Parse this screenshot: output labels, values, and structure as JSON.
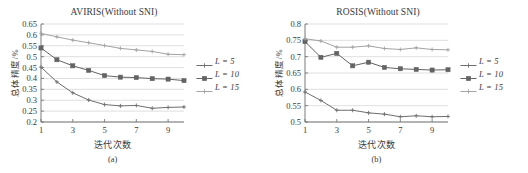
{
  "figure": {
    "panels": [
      {
        "caption": "(a)",
        "chart_data": {
          "type": "line",
          "title": "AVIRIS(Without SNI)",
          "xlabel": "迭代次数",
          "ylabel": "总体精度/%",
          "x": [
            1,
            2,
            3,
            4,
            5,
            6,
            7,
            8,
            9,
            10
          ],
          "xticks": [
            1,
            3,
            5,
            7,
            9
          ],
          "xtick_labels": [
            "1",
            "3",
            "5",
            "7",
            "9"
          ],
          "xlim": [
            1,
            10
          ],
          "yticks": [
            0.2,
            0.25,
            0.3,
            0.35,
            0.4,
            0.45,
            0.5,
            0.55,
            0.6,
            0.65
          ],
          "ytick_labels": [
            "0.2",
            "0.25",
            "0.3",
            "0.35",
            "0.4",
            "0.45",
            "0.5",
            "0.55",
            "0.6",
            "0.65"
          ],
          "ylim": [
            0.2,
            0.65
          ],
          "grid": "horizontal",
          "legend_position": "right-outside",
          "series": [
            {
              "name": "L = 5",
              "color": "#6e6e6e",
              "marker": "plus",
              "values": [
                0.452,
                0.384,
                0.334,
                0.301,
                0.28,
                0.274,
                0.276,
                0.263,
                0.267,
                0.269
              ]
            },
            {
              "name": "L = 10",
              "color": "#636363",
              "marker": "square",
              "values": [
                0.54,
                0.486,
                0.458,
                0.437,
                0.413,
                0.406,
                0.404,
                0.399,
                0.397,
                0.39
              ]
            },
            {
              "name": "L = 15",
              "color": "#a3a3a3",
              "marker": "plus",
              "values": [
                0.607,
                0.591,
                0.576,
                0.564,
                0.551,
                0.538,
                0.531,
                0.524,
                0.511,
                0.509
              ]
            }
          ]
        }
      },
      {
        "caption": "(b)",
        "chart_data": {
          "type": "line",
          "title": "ROSIS(Without SNI)",
          "xlabel": "迭代次数",
          "ylabel": "总体精度/%",
          "x": [
            1,
            2,
            3,
            4,
            5,
            6,
            7,
            8,
            9,
            10
          ],
          "xticks": [
            1,
            3,
            5,
            7,
            9
          ],
          "xtick_labels": [
            "1",
            "3",
            "5",
            "7",
            "9"
          ],
          "xlim": [
            1,
            10
          ],
          "yticks": [
            0.5,
            0.55,
            0.6,
            0.65,
            0.7,
            0.75,
            0.8
          ],
          "ytick_labels": [
            "0.5",
            "0.55",
            "0.6",
            "0.65",
            "0.7",
            "0.75",
            "0.8"
          ],
          "ylim": [
            0.5,
            0.8
          ],
          "grid": "horizontal",
          "legend_position": "right-outside",
          "series": [
            {
              "name": "L = 5",
              "color": "#6e6e6e",
              "marker": "plus",
              "values": [
                0.592,
                0.566,
                0.536,
                0.536,
                0.528,
                0.524,
                0.516,
                0.519,
                0.516,
                0.517
              ]
            },
            {
              "name": "L = 10",
              "color": "#636363",
              "marker": "square",
              "values": [
                0.746,
                0.698,
                0.71,
                0.672,
                0.683,
                0.667,
                0.663,
                0.661,
                0.659,
                0.66
              ]
            },
            {
              "name": "L = 15",
              "color": "#a3a3a3",
              "marker": "plus",
              "values": [
                0.755,
                0.748,
                0.729,
                0.729,
                0.733,
                0.725,
                0.722,
                0.727,
                0.722,
                0.721
              ]
            }
          ]
        }
      }
    ]
  },
  "colors": {
    "axis": "#6b6b6b",
    "grid": "#c9c9c9",
    "text": "#3a3a3a",
    "background": "#ffffff"
  }
}
